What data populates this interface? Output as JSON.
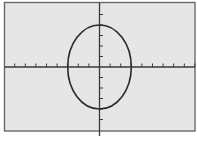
{
  "chart_data": {
    "type": "line",
    "title": "",
    "xlabel": "",
    "ylabel": "",
    "equation": "x^2/9 + y^2/16 = 1",
    "curve": "ellipse",
    "center": [
      0,
      0
    ],
    "semi_axis_x": 3,
    "semi_axis_y": 4,
    "xlim": [
      -9,
      9
    ],
    "ylim": [
      -6,
      6
    ],
    "xscale": 1,
    "yscale": 1,
    "grid": false,
    "legend": "none",
    "x_ticks": [
      -8,
      -7,
      -6,
      -5,
      -4,
      -3,
      -2,
      -1,
      1,
      2,
      3,
      4,
      5,
      6,
      7,
      8,
      9
    ],
    "y_ticks": [
      -5,
      -4,
      -3,
      -2,
      -1,
      1,
      2,
      3,
      4,
      5
    ],
    "tick_labels_shown": false
  },
  "colors": {
    "screen_background": "#e6e6e6",
    "frame": "#6a6a6a",
    "axes": "#3a3a3a",
    "curve": "#2a2a2a",
    "page_background": "#ffffff"
  }
}
